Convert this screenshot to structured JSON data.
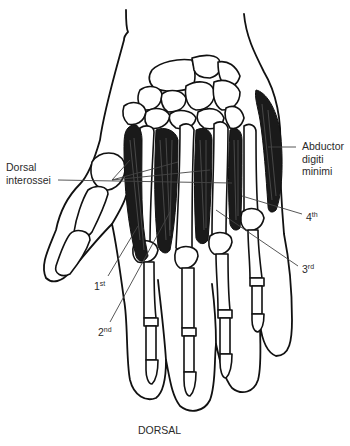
{
  "figure": {
    "view": "DORSAL"
  },
  "labels": {
    "dorsal_interossei": {
      "line1": "Dorsal",
      "line2": "interossei"
    },
    "abductor": {
      "line1": "Abductor",
      "line2": "digiti",
      "line3": "minimi"
    },
    "first": {
      "num": "1",
      "sup": "st"
    },
    "second": {
      "num": "2",
      "sup": "nd"
    },
    "third": {
      "num": "3",
      "sup": "rd"
    },
    "fourth": {
      "num": "4",
      "sup": "th"
    },
    "caption": "DORSAL"
  },
  "colors": {
    "ink": "#111111",
    "muscle": "#1a1a1a",
    "label_text": "#2a2a2a",
    "background": "#ffffff"
  }
}
